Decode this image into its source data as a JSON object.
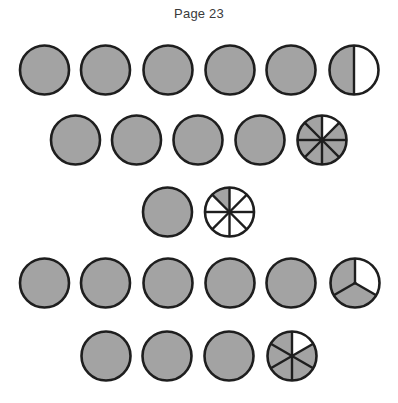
{
  "page": {
    "title": "Page 23"
  },
  "style": {
    "shaded_color": "#a3a3a3",
    "unshaded_color": "#ffffff",
    "stroke_color": "#1e1e1e"
  },
  "figure": {
    "radius": 24.5,
    "rows": [
      {
        "cy": 70,
        "circles": [
          {
            "cx": 44.5,
            "parts": 1,
            "shaded": 1
          },
          {
            "cx": 105.5,
            "parts": 1,
            "shaded": 1
          },
          {
            "cx": 168,
            "parts": 1,
            "shaded": 1
          },
          {
            "cx": 230,
            "parts": 1,
            "shaded": 1
          },
          {
            "cx": 291,
            "parts": 1,
            "shaded": 1
          },
          {
            "cx": 354,
            "parts": 2,
            "shaded": 1,
            "unshaded_slices": [
              0
            ],
            "layout": "vertical-halves",
            "shaded_side": "left"
          }
        ],
        "fraction": "5 1/2"
      },
      {
        "cy": 140,
        "circles": [
          {
            "cx": 75.5,
            "parts": 1,
            "shaded": 1
          },
          {
            "cx": 136.5,
            "parts": 1,
            "shaded": 1
          },
          {
            "cx": 198,
            "parts": 1,
            "shaded": 1
          },
          {
            "cx": 260,
            "parts": 1,
            "shaded": 1
          },
          {
            "cx": 322,
            "parts": 8,
            "shaded": 7,
            "unshaded_slices": [
              0
            ]
          }
        ],
        "fraction": "4 7/8"
      },
      {
        "cy": 212,
        "circles": [
          {
            "cx": 167.5,
            "parts": 1,
            "shaded": 1
          },
          {
            "cx": 229.5,
            "parts": 8,
            "shaded": 1,
            "shaded_slices": [
              7
            ]
          }
        ],
        "fraction": "1 1/8"
      },
      {
        "cy": 283,
        "circles": [
          {
            "cx": 44.5,
            "parts": 1,
            "shaded": 1
          },
          {
            "cx": 105.5,
            "parts": 1,
            "shaded": 1
          },
          {
            "cx": 168,
            "parts": 1,
            "shaded": 1
          },
          {
            "cx": 230,
            "parts": 1,
            "shaded": 1
          },
          {
            "cx": 291,
            "parts": 1,
            "shaded": 1
          },
          {
            "cx": 355,
            "parts": 3,
            "shaded": 2,
            "unshaded_slices": [
              0
            ]
          }
        ],
        "fraction": "5 2/3"
      },
      {
        "cy": 356,
        "circles": [
          {
            "cx": 106,
            "parts": 1,
            "shaded": 1
          },
          {
            "cx": 167,
            "parts": 1,
            "shaded": 1
          },
          {
            "cx": 229,
            "parts": 1,
            "shaded": 1
          },
          {
            "cx": 292,
            "parts": 6,
            "shaded": 5,
            "unshaded_slices": [
              0
            ]
          }
        ],
        "fraction": "3 5/6"
      }
    ]
  }
}
